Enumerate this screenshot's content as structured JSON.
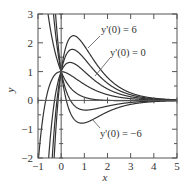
{
  "chart_data": {
    "type": "line",
    "title": "",
    "xlabel": "x",
    "ylabel": "y",
    "xlim": [
      -1,
      5
    ],
    "ylim": [
      -2,
      3
    ],
    "xticks": [
      "-1",
      "0",
      "1",
      "2",
      "3",
      "4",
      "5"
    ],
    "yticks": [
      "-2",
      "-1",
      "0",
      "1",
      "2",
      "3"
    ],
    "grid": false,
    "legend": "none",
    "series": [
      {
        "name": "y'(0) = -6",
        "v": -6
      },
      {
        "name": "y'(0) = -4",
        "v": -4
      },
      {
        "name": "y'(0) = -2",
        "v": -2
      },
      {
        "name": "y'(0) = 0",
        "v": 0
      },
      {
        "name": "y'(0) = 2",
        "v": 2
      },
      {
        "name": "y'(0) = 4",
        "v": 4
      },
      {
        "name": "y'(0) = 6",
        "v": 6
      }
    ],
    "annotations": [
      {
        "text": "y'(0) = 6",
        "x": 2.2,
        "y": 2.45
      },
      {
        "text": "y'(0) = 0",
        "x": 2.7,
        "y": 1.55
      },
      {
        "text": "y'(0) = −6",
        "x": 2.0,
        "y": -0.95
      }
    ]
  },
  "labels": {
    "x_axis": "x",
    "y_axis": "y",
    "ann_top": "y'(0) = 6",
    "ann_mid": "y'(0) = 0",
    "ann_bot": "y'(0) = −6"
  }
}
